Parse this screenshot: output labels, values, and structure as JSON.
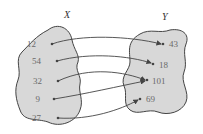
{
  "diagram": {
    "sets": [
      {
        "name": "X",
        "elements": [
          "12",
          "54",
          "32",
          "9",
          "27"
        ]
      },
      {
        "name": "Y",
        "elements": [
          "43",
          "18",
          "101",
          "69"
        ]
      }
    ],
    "mappings": [
      {
        "from": "12",
        "to": "43"
      },
      {
        "from": "54",
        "to": "18"
      },
      {
        "from": "32",
        "to": "101"
      },
      {
        "from": "9",
        "to": "101"
      },
      {
        "from": "27",
        "to": "69"
      }
    ],
    "colors": {
      "blob_fill": "#d8d8d8",
      "outline": "#444444",
      "text": "#6a6a6a"
    }
  }
}
